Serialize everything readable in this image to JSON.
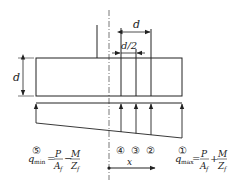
{
  "diagram": {
    "type": "foundation-slab-pressure-distribution",
    "labels": {
      "slab_thickness": "d",
      "offset_d": "d",
      "offset_half_d": "d/2",
      "x_axis": "x"
    },
    "sections": [
      {
        "id": "1",
        "marker": "①"
      },
      {
        "id": "2",
        "marker": "②"
      },
      {
        "id": "3",
        "marker": "③"
      },
      {
        "id": "4",
        "marker": "④"
      },
      {
        "id": "5",
        "marker": "⑤"
      }
    ],
    "formulas": {
      "q_min": {
        "marker": "⑤",
        "lhs": "q",
        "lhs_sub": "min",
        "eq": "=",
        "term1_num": "P",
        "term1_den": "A",
        "term1_den_sub": "f",
        "op": "−",
        "term2_num": "M",
        "term2_den": "Z",
        "term2_den_sub": "f"
      },
      "q_max": {
        "marker": "①",
        "lhs": "q",
        "lhs_sub": "max",
        "eq": "=",
        "term1_num": "P",
        "term1_den": "A",
        "term1_den_sub": "f",
        "op": "+",
        "term2_num": "M",
        "term2_den": "Z",
        "term2_den_sub": "f"
      }
    },
    "colors": {
      "line": "#222222",
      "background": "#ffffff"
    }
  }
}
